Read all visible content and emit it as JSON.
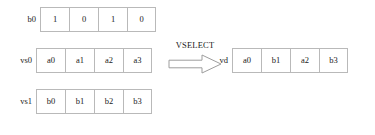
{
  "diagram": {
    "operator": {
      "label": "VSELECT",
      "arrow_icon": "block-arrow-right-icon"
    },
    "colors": {
      "border": "#b9b9b9",
      "cell_background": "#ffffff",
      "text": "#1a1a1a",
      "page_background": "#ffffff"
    },
    "inputs": [
      {
        "name": "b0",
        "label": "b0",
        "role": "mask",
        "cells": [
          "1",
          "0",
          "1",
          "0"
        ]
      },
      {
        "name": "vs0",
        "label": "vs0",
        "role": "source-a",
        "cells": [
          "a0",
          "a1",
          "a2",
          "a3"
        ]
      },
      {
        "name": "vs1",
        "label": "vs1",
        "role": "source-b",
        "cells": [
          "b0",
          "b1",
          "b2",
          "b3"
        ]
      }
    ],
    "output": {
      "name": "vd",
      "label": "vd",
      "role": "destination",
      "cells": [
        "a0",
        "b1",
        "a2",
        "b3"
      ]
    }
  }
}
